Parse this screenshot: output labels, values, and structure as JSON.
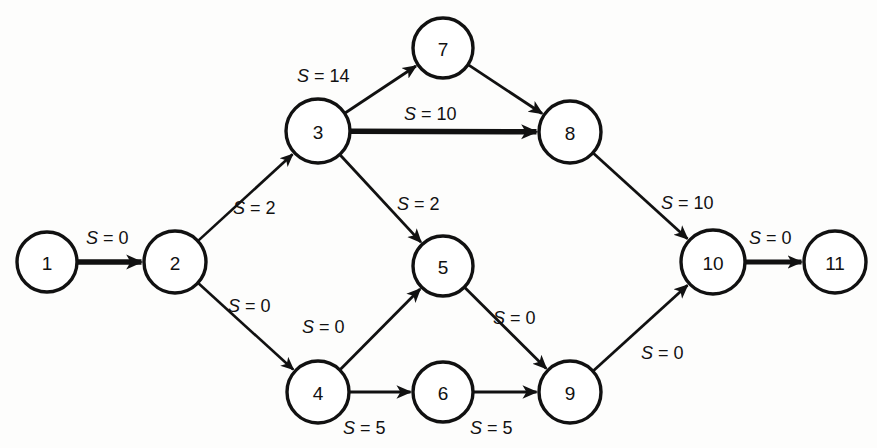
{
  "diagram": {
    "type": "directed-network-graph",
    "label_prefix": "S",
    "label_separator": "=",
    "stroke_color": "#111111",
    "node_fill": "#ffffff",
    "background": "#fdfdfc",
    "nodes": [
      {
        "id": "1",
        "label": "1",
        "cx": 47,
        "cy": 262,
        "r": 30
      },
      {
        "id": "2",
        "label": "2",
        "cx": 175,
        "cy": 262,
        "r": 31
      },
      {
        "id": "3",
        "label": "3",
        "cx": 318,
        "cy": 131,
        "r": 32
      },
      {
        "id": "4",
        "label": "4",
        "cx": 318,
        "cy": 392,
        "r": 31
      },
      {
        "id": "5",
        "label": "5",
        "cx": 443,
        "cy": 266,
        "r": 30
      },
      {
        "id": "6",
        "label": "6",
        "cx": 443,
        "cy": 392,
        "r": 30
      },
      {
        "id": "7",
        "label": "7",
        "cx": 443,
        "cy": 48,
        "r": 30
      },
      {
        "id": "8",
        "label": "8",
        "cx": 570,
        "cy": 132,
        "r": 31
      },
      {
        "id": "9",
        "label": "9",
        "cx": 570,
        "cy": 392,
        "r": 31
      },
      {
        "id": "10",
        "label": "10",
        "cx": 713,
        "cy": 262,
        "r": 32
      },
      {
        "id": "11",
        "label": "11",
        "cx": 835,
        "cy": 262,
        "r": 31
      }
    ],
    "edges": [
      {
        "from": "1",
        "to": "2",
        "label": "S  =  0",
        "value": 0,
        "lx": 86,
        "ly": 238,
        "thick": 5.5
      },
      {
        "from": "2",
        "to": "3",
        "label": "S  =  2",
        "value": 2,
        "lx": 233,
        "ly": 208,
        "thick": 2.6
      },
      {
        "from": "2",
        "to": "4",
        "label": "S  =  0",
        "value": 0,
        "lx": 228,
        "ly": 306,
        "thick": 2.6
      },
      {
        "from": "3",
        "to": "7",
        "label": "S  =  14",
        "value": 14,
        "lx": 297,
        "ly": 76,
        "thick": 2.8
      },
      {
        "from": "3",
        "to": "8",
        "label": "S  =  10",
        "value": 10,
        "lx": 404,
        "ly": 114,
        "thick": 5.5
      },
      {
        "from": "3",
        "to": "5",
        "label": "S  =  2",
        "value": 2,
        "lx": 397,
        "ly": 204,
        "thick": 2.8
      },
      {
        "from": "4",
        "to": "5",
        "label": "S  =  0",
        "value": 0,
        "lx": 302,
        "ly": 327,
        "thick": 2.8
      },
      {
        "from": "4",
        "to": "6",
        "label": "S  =  5",
        "value": 5,
        "lx": 343,
        "ly": 428,
        "thick": 3.0
      },
      {
        "from": "5",
        "to": "9",
        "label": "S  =  0",
        "value": 0,
        "lx": 493,
        "ly": 318,
        "thick": 2.8
      },
      {
        "from": "6",
        "to": "9",
        "label": "S  =  5",
        "value": 5,
        "lx": 470,
        "ly": 428,
        "thick": 3.0
      },
      {
        "from": "7",
        "to": "8",
        "label": "",
        "value": null,
        "lx": null,
        "ly": null,
        "thick": 2.8
      },
      {
        "from": "8",
        "to": "10",
        "label": "S  =  10",
        "value": 10,
        "lx": 661,
        "ly": 203,
        "thick": 2.8
      },
      {
        "from": "9",
        "to": "10",
        "label": "S  =  0",
        "value": 0,
        "lx": 641,
        "ly": 353,
        "thick": 2.8
      },
      {
        "from": "10",
        "to": "11",
        "label": "S  =  0",
        "value": 0,
        "lx": 749,
        "ly": 238,
        "thick": 5.0
      }
    ]
  }
}
